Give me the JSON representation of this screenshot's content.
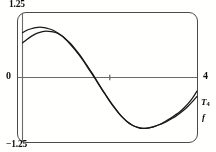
{
  "chart_data": {
    "type": "line",
    "title": "",
    "subtitle": "",
    "xlabel": "",
    "ylabel": "",
    "xlim": [
      0,
      4
    ],
    "ylim": [
      -1.25,
      1.25
    ],
    "grid": false,
    "legend_position": "right-edge",
    "axis_labels": {
      "y_max": "1.25",
      "y_min": "−1.25",
      "x_min": "0",
      "x_max": "4"
    },
    "x_axis_tick_values": [
      2
    ],
    "series": [
      {
        "name": "T₄",
        "label_text": "T",
        "label_subscript": "4",
        "color": "#1a1a1a",
        "x": [
          0,
          0.1,
          0.2,
          0.3,
          0.4,
          0.5,
          0.6,
          0.7,
          0.8,
          0.9,
          1.0,
          1.1,
          1.2,
          1.3,
          1.4,
          1.5,
          1.6,
          1.7,
          1.8,
          1.9,
          2.0,
          2.1,
          2.2,
          2.3,
          2.4,
          2.5,
          2.6,
          2.7,
          2.8,
          2.9,
          3.0,
          3.1,
          3.2,
          3.3,
          3.4,
          3.5,
          3.6,
          3.7,
          3.8,
          3.9,
          4.0
        ],
        "y": [
          0.88,
          0.93,
          0.96,
          0.98,
          0.99,
          0.98,
          0.96,
          0.93,
          0.88,
          0.82,
          0.74,
          0.65,
          0.55,
          0.44,
          0.32,
          0.19,
          0.06,
          -0.07,
          -0.21,
          -0.34,
          -0.47,
          -0.59,
          -0.7,
          -0.79,
          -0.87,
          -0.93,
          -0.97,
          -0.99,
          -1.0,
          -0.99,
          -0.97,
          -0.94,
          -0.9,
          -0.85,
          -0.8,
          -0.74,
          -0.68,
          -0.6,
          -0.51,
          -0.4,
          -0.27
        ]
      },
      {
        "name": "f",
        "label_text": "f",
        "color": "#1a1a1a",
        "x": [
          0,
          0.1,
          0.2,
          0.3,
          0.4,
          0.5,
          0.6,
          0.7,
          0.8,
          0.9,
          1.0,
          1.1,
          1.2,
          1.3,
          1.4,
          1.5,
          1.6,
          1.7,
          1.8,
          1.9,
          2.0,
          2.1,
          2.2,
          2.3,
          2.4,
          2.5,
          2.6,
          2.7,
          2.8,
          2.9,
          3.0,
          3.1,
          3.2,
          3.3,
          3.4,
          3.5,
          3.6,
          3.7,
          3.8,
          3.9,
          4.0
        ],
        "y": [
          0.68,
          0.75,
          0.81,
          0.86,
          0.89,
          0.91,
          0.91,
          0.9,
          0.87,
          0.82,
          0.75,
          0.67,
          0.57,
          0.46,
          0.34,
          0.21,
          0.08,
          -0.06,
          -0.2,
          -0.33,
          -0.46,
          -0.58,
          -0.69,
          -0.79,
          -0.87,
          -0.93,
          -0.97,
          -1.0,
          -1.0,
          -0.99,
          -0.97,
          -0.94,
          -0.91,
          -0.87,
          -0.82,
          -0.77,
          -0.71,
          -0.64,
          -0.56,
          -0.47,
          -0.37
        ]
      }
    ]
  },
  "frame": {
    "border_color": "#4b4b4b",
    "axis_color": "#555555"
  }
}
